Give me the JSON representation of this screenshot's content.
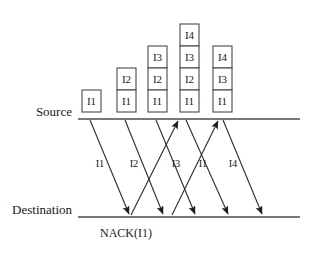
{
  "figure": {
    "type": "sequence-diagram",
    "title": "",
    "timelines": [
      {
        "id": "source",
        "label": "Source",
        "y": 119,
        "x_start": 78,
        "x_end": 300
      },
      {
        "id": "destination",
        "label": "Destination",
        "y": 217,
        "x_start": 78,
        "x_end": 300
      }
    ],
    "packet_stacks": [
      {
        "id": "stack-1",
        "x": 82,
        "width": 19,
        "box_height": 22,
        "items": [
          "I1"
        ]
      },
      {
        "id": "stack-2",
        "x": 117,
        "width": 19,
        "box_height": 22,
        "items": [
          "I2",
          "I1"
        ]
      },
      {
        "id": "stack-3",
        "x": 148,
        "width": 19,
        "box_height": 22,
        "items": [
          "I3",
          "I2",
          "I1"
        ]
      },
      {
        "id": "stack-4",
        "x": 180,
        "width": 19,
        "box_height": 22,
        "items": [
          "I4",
          "I3",
          "I2",
          "I1"
        ]
      },
      {
        "id": "stack-5",
        "x": 213,
        "width": 19,
        "box_height": 22,
        "items": [
          "I4",
          "I3",
          "I1"
        ]
      }
    ],
    "messages": [
      {
        "id": "msg-i1",
        "label": "I1",
        "direction": "down",
        "x1": 90,
        "y1": 120,
        "x2": 129,
        "y2": 214,
        "label_x": 100,
        "label_y": 167
      },
      {
        "id": "msg-i2",
        "label": "I2",
        "direction": "down",
        "x1": 125,
        "y1": 120,
        "x2": 163,
        "y2": 214,
        "label_x": 134,
        "label_y": 167
      },
      {
        "id": "msg-i3",
        "label": "I3",
        "direction": "down",
        "x1": 156,
        "y1": 120,
        "x2": 195,
        "y2": 214,
        "label_x": 176,
        "label_y": 167
      },
      {
        "id": "msg-nack1",
        "label": "",
        "direction": "up",
        "x1": 131,
        "y1": 215,
        "x2": 178,
        "y2": 121,
        "label_x": 0,
        "label_y": 0
      },
      {
        "id": "msg-i1r",
        "label": "I1",
        "direction": "down",
        "x1": 186,
        "y1": 120,
        "x2": 228,
        "y2": 214,
        "label_x": 203,
        "label_y": 167
      },
      {
        "id": "msg-nack2",
        "label": "",
        "direction": "up",
        "x1": 172,
        "y1": 215,
        "x2": 218,
        "y2": 121,
        "label_x": 0,
        "label_y": 0
      },
      {
        "id": "msg-i4",
        "label": "I4",
        "direction": "down",
        "x1": 223,
        "y1": 120,
        "x2": 262,
        "y2": 214,
        "label_x": 233,
        "label_y": 167
      }
    ],
    "annotations": [
      {
        "id": "nack-annotation",
        "text": "NACK(I1)",
        "x": 100,
        "y": 237
      }
    ],
    "colors": {
      "line": "#4d4d4d",
      "flow": "#2b2b2b",
      "box_stroke": "#4a4a4a",
      "box_fill": "#ffffff",
      "text": "#1a1a1a",
      "background": "#ffffff"
    }
  }
}
